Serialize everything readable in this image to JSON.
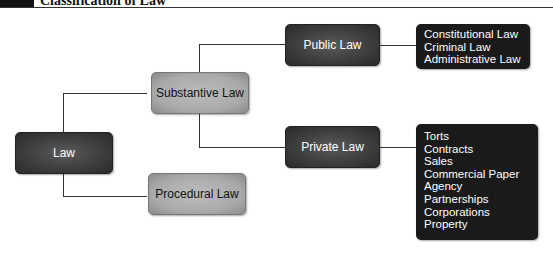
{
  "header": {
    "badge": "",
    "title": "Classification of Law"
  },
  "nodes": {
    "law": "Law",
    "substantive": "Substantive Law",
    "procedural": "Procedural Law",
    "public": "Public Law",
    "private": "Private Law"
  },
  "public_list": [
    "Constitutional Law",
    "Criminal Law",
    "Administrative Law"
  ],
  "private_list": [
    "Torts",
    "Contracts",
    "Sales",
    "Commercial Paper",
    "Agency",
    "Partnerships",
    "Corporations",
    "Property"
  ]
}
